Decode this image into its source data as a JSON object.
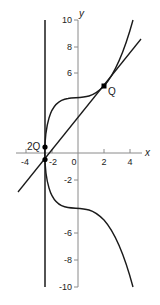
{
  "diagram": {
    "axes": {
      "x_label": "x",
      "y_label": "y",
      "x_ticks": [
        "-4",
        "-2",
        "0",
        "2",
        "4"
      ],
      "y_ticks": [
        "10",
        "8",
        "6",
        "-2",
        "-6",
        "-8",
        "-10"
      ],
      "xlim": [
        -5.5,
        5.5
      ],
      "ylim": [
        -10,
        10
      ]
    },
    "curve": {
      "equation": "y^2 = x^3 + 17",
      "color": "#1a1a1a"
    },
    "tangent_line": {
      "through": "Q",
      "slope": 1.2,
      "color": "#1a1a1a"
    },
    "vertical_line": {
      "x": -2.56,
      "color": "#1a1a1a"
    },
    "points": [
      {
        "label": "Q",
        "x": 2,
        "y": 5
      },
      {
        "label": "2Q",
        "x": -2.56,
        "y": 0.472
      },
      {
        "label": "",
        "x": -2.56,
        "y": -0.472
      }
    ],
    "axis_color": "#888888"
  }
}
